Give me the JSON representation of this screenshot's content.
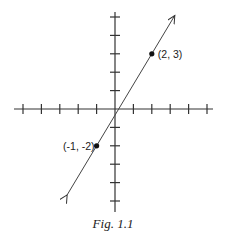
{
  "chart_data": {
    "type": "line",
    "title": "",
    "caption": "Fig. 1.1",
    "xlabel": "",
    "ylabel": "",
    "xlim": [
      -5.5,
      5.3
    ],
    "ylim": [
      -5.5,
      5.3
    ],
    "x_ticks": [
      -5,
      -4,
      -3,
      -2,
      -1,
      1,
      2,
      3,
      4,
      5
    ],
    "y_ticks": [
      -5,
      -4,
      -3,
      -2,
      -1,
      1,
      2,
      3,
      4,
      5
    ],
    "tick_labels_shown": false,
    "grid": false,
    "line": {
      "equation": "y = (5/3)x - 1/3",
      "through_points": [
        [
          -1,
          -2
        ],
        [
          2,
          3
        ]
      ],
      "arrows_both_ends": true
    },
    "points": [
      {
        "x": 2,
        "y": 3,
        "label": "(2, 3)"
      },
      {
        "x": -1,
        "y": -2,
        "label": "(-1, -2)"
      }
    ]
  },
  "figure": {
    "caption": "Fig. 1.1",
    "point_a_label": "(2, 3)",
    "point_b_label": "(-1, -2)"
  }
}
